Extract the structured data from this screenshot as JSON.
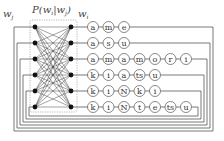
{
  "diagram": {
    "left_label": "w_j",
    "left_label_main": "w",
    "left_label_sub": "j",
    "right_label_main": "w",
    "right_label_sub": "i",
    "prob_label": "P(w_i|w_j)",
    "prob_label_text": "P(w",
    "prob_label_sub1": "i",
    "prob_label_mid": "|w",
    "prob_label_sub2": "j",
    "prob_label_end": ")",
    "words": [
      {
        "chars": [
          "a",
          "m",
          "e"
        ]
      },
      {
        "chars": [
          "a",
          "s",
          "u"
        ]
      },
      {
        "chars": [
          "a",
          "m",
          "a",
          "m",
          "o",
          "r",
          "i"
        ]
      },
      {
        "chars": [
          "k",
          "i",
          "a",
          "ts",
          "u"
        ]
      },
      {
        "chars": [
          "k",
          "i",
          "N",
          "k",
          "i"
        ]
      },
      {
        "chars": [
          "k",
          "i",
          "N",
          "t",
          "e",
          "ts",
          "u"
        ]
      }
    ],
    "node_color": "#111111",
    "line_color": "#555555"
  }
}
